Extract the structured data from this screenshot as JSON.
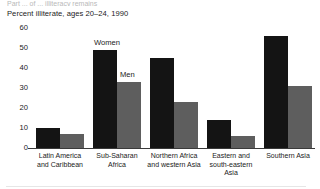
{
  "header": {
    "clipped_line": "Part ... of ... illiteracy remains"
  },
  "chart_data": {
    "type": "bar",
    "title": "Percent illiterate, ages 20–24, 1990",
    "xlabel": "",
    "ylabel": "",
    "ylim": [
      0,
      60
    ],
    "yticks": [
      60,
      50,
      40,
      30,
      20,
      10,
      0
    ],
    "grid": false,
    "legend_position": "inline-annotations",
    "categories": [
      "Latin America and Caribbean",
      "Sub-Saharan Africa",
      "Northern Africa and western Asia",
      "Eastern and south-eastern Asia",
      "Southern Asia"
    ],
    "category_lines": [
      [
        "Latin America",
        "and Caribbean"
      ],
      [
        "Sub-Saharan",
        "Africa"
      ],
      [
        "Northern Africa",
        "and western Asia"
      ],
      [
        "Eastern and",
        "south-eastern",
        "Asia"
      ],
      [
        "Southern Asia"
      ]
    ],
    "series": [
      {
        "name": "Women",
        "color": "#141414",
        "values": [
          10,
          49,
          45,
          14,
          56
        ]
      },
      {
        "name": "Men",
        "color": "#5e5e5e",
        "values": [
          7,
          33,
          23,
          6,
          31
        ]
      }
    ],
    "annotations": [
      {
        "text": "Women",
        "target_series": "Women",
        "target_category": "Sub-Saharan Africa"
      },
      {
        "text": "Men",
        "target_series": "Men",
        "target_category": "Sub-Saharan Africa"
      }
    ]
  }
}
